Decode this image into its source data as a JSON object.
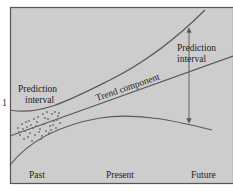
{
  "diagram": {
    "type": "forecast-trend-diagram",
    "colors": {
      "background": "#cdcdcd",
      "frame": "#555555",
      "curve": "#5a5a5a",
      "text": "#222222",
      "scatter": "#6a6a6a"
    },
    "labels": {
      "prediction_interval_left_line1": "Prediction",
      "prediction_interval_left_line2": "interval",
      "prediction_interval_right_line1": "Prediction",
      "prediction_interval_right_line2": "interval",
      "trend_component": "Trend component"
    },
    "x_axis": {
      "ticks": [
        "Past",
        "Present",
        "Future"
      ]
    },
    "stray_mark": "1"
  }
}
